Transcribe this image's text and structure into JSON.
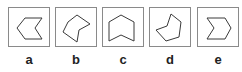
{
  "figure": {
    "options": [
      {
        "label": "a",
        "shape": "pentagon-notched-right",
        "points": "16,10 33,10 26,20 33,31 16,31 8,20"
      },
      {
        "label": "b",
        "shape": "irregular-hexagon-concave",
        "points": "12,14 21,7 34,16 23,22 21,34 7,24"
      },
      {
        "label": "c",
        "shape": "house-chevron-up-notched-bottom",
        "points": "6,14 18,7 31,14 31,33 18,27 6,33"
      },
      {
        "label": "d",
        "shape": "irregular-hexagon-rotated",
        "points": "21,6 31,14 29,29 16,33 6,22 17,18"
      },
      {
        "label": "e",
        "shape": "chevron-right-hexagon",
        "points": "9,10 27,10 33,20 27,31 9,31 16,20"
      }
    ]
  },
  "colors": {
    "stroke": "#3a3a3a",
    "border": "#8a8a8a"
  }
}
